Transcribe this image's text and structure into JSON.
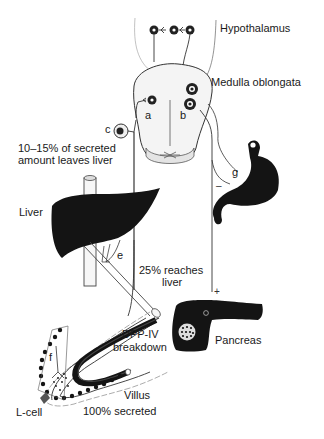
{
  "diagram": {
    "type": "physiology-schematic"
  },
  "labels": {
    "hypothalamus": "Hypothalamus",
    "medulla": "Medulla oblongata",
    "leaves_liver_1": "10–15% of secreted",
    "leaves_liver_2": "amount leaves liver",
    "liver": "Liver",
    "reaches_liver_1": "25% reaches",
    "reaches_liver_2": "liver",
    "dpp_1": "DPP-IV",
    "dpp_2": "breakdown",
    "pancreas": "Pancreas",
    "villus": "Villus",
    "lcell": "L-cell",
    "secreted": "100% secreted"
  },
  "pathway_letters": {
    "a": "a",
    "b": "b",
    "c": "c",
    "e": "e",
    "f": "f",
    "g": "g"
  },
  "signs": {
    "stomach_inhibit": "–",
    "pancreas_stimulate": "+"
  },
  "colors": {
    "ink": "#1a1a1a",
    "organ_fill": "#141414",
    "line": "#333333",
    "brain_fill": "#f2f2f2",
    "vessel_fill": "#f7f7f7"
  }
}
